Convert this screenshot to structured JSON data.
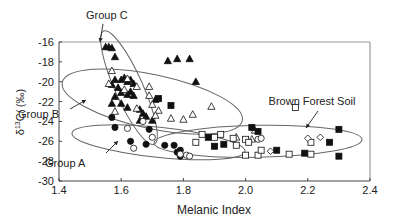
{
  "chart_data": {
    "type": "scatter",
    "title": "",
    "xlabel": "Melanic Index",
    "ylabel": "δ13C/ (‰)",
    "xlim": [
      1.4,
      2.4
    ],
    "ylim": [
      -30,
      -16
    ],
    "xticks": [
      "1.4",
      "1.6",
      "1.8",
      "2.0",
      "2.2",
      "2.4"
    ],
    "yticks": [
      "-16",
      "-18",
      "-20",
      "-22",
      "-24",
      "-26",
      "-28",
      "-30"
    ],
    "grid": false,
    "legend": null,
    "annotations": [
      {
        "text": "Group C",
        "x": 1.56,
        "y": -16.2
      },
      {
        "text": "Group B",
        "x": 1.58,
        "y": -22.4
      },
      {
        "text": "Group A",
        "x": 1.64,
        "y": -26.0
      },
      {
        "text": "Brown Forest Soil",
        "x": 2.06,
        "y": -23.4
      }
    ],
    "groups": [
      {
        "name": "Group C",
        "cx": 1.62,
        "cy": -21.5,
        "rx": 0.22,
        "ry": 0.045,
        "angle_deg": 62
      },
      {
        "name": "Group B",
        "cx": 1.68,
        "cy": -22.6,
        "rx": 0.29,
        "ry": 0.18,
        "angle_deg": 0
      },
      {
        "name": "Group A",
        "cx": 1.7,
        "cy": -26.2,
        "rx": 0.27,
        "ry": 0.07,
        "angle_deg": 0
      },
      {
        "name": "Brown Forest Soil",
        "cx": 2.03,
        "cy": -25.8,
        "rx": 0.33,
        "ry": 0.11,
        "angle_deg": 0
      }
    ],
    "series": [
      {
        "name": "filled-triangle",
        "marker": "triangle",
        "filled": true,
        "points": [
          [
            1.55,
            -16.5
          ],
          [
            1.56,
            -16.5
          ],
          [
            1.57,
            -16.6
          ],
          [
            1.58,
            -17.5
          ],
          [
            1.58,
            -19.8
          ],
          [
            1.6,
            -19.8
          ],
          [
            1.61,
            -19.6
          ],
          [
            1.62,
            -20.0
          ],
          [
            1.63,
            -19.8
          ],
          [
            1.64,
            -20.2
          ],
          [
            1.59,
            -20.6
          ],
          [
            1.57,
            -20.3
          ],
          [
            1.6,
            -21.1
          ],
          [
            1.62,
            -21.3
          ],
          [
            1.63,
            -21.0
          ],
          [
            1.64,
            -21.4
          ],
          [
            1.58,
            -21.5
          ],
          [
            1.6,
            -22.2
          ],
          [
            1.62,
            -22.6
          ],
          [
            1.57,
            -22.2
          ],
          [
            1.66,
            -22.8
          ],
          [
            1.67,
            -23.2
          ],
          [
            1.68,
            -23.5
          ],
          [
            1.66,
            -23.9
          ],
          [
            1.7,
            -23.9
          ],
          [
            1.71,
            -21.8
          ],
          [
            1.75,
            -17.9
          ],
          [
            1.78,
            -17.7
          ],
          [
            1.82,
            -17.7
          ],
          [
            1.84,
            -20.0
          ]
        ]
      },
      {
        "name": "open-triangle",
        "marker": "triangle",
        "filled": false,
        "points": [
          [
            1.57,
            -18.9
          ],
          [
            1.56,
            -20.2
          ],
          [
            1.62,
            -19.7
          ],
          [
            1.61,
            -20.8
          ],
          [
            1.65,
            -20.5
          ],
          [
            1.69,
            -20.5
          ],
          [
            1.69,
            -21.4
          ],
          [
            1.7,
            -22.3
          ],
          [
            1.72,
            -22.9
          ],
          [
            1.65,
            -22.7
          ],
          [
            1.58,
            -23.0
          ],
          [
            1.71,
            -23.4
          ],
          [
            1.76,
            -23.7
          ],
          [
            1.8,
            -23.8
          ],
          [
            1.83,
            -23.3
          ],
          [
            1.89,
            -22.5
          ],
          [
            1.97,
            -25.6
          ],
          [
            2.02,
            -25.8
          ],
          [
            2.03,
            -24.9
          ]
        ]
      },
      {
        "name": "filled-circle",
        "marker": "circle",
        "filled": true,
        "points": [
          [
            1.57,
            -23.6
          ],
          [
            1.58,
            -24.6
          ],
          [
            1.63,
            -26.0
          ],
          [
            1.68,
            -26.3
          ],
          [
            1.69,
            -24.8
          ],
          [
            1.74,
            -26.4
          ],
          [
            1.77,
            -26.4
          ],
          [
            1.78,
            -27.1
          ],
          [
            1.79,
            -27.5
          ],
          [
            1.79,
            -26.9
          ]
        ]
      },
      {
        "name": "open-circle",
        "marker": "circle",
        "filled": false,
        "points": [
          [
            1.62,
            -24.7
          ],
          [
            1.64,
            -26.7
          ],
          [
            1.67,
            -24.0
          ],
          [
            1.7,
            -25.6
          ],
          [
            1.79,
            -27.3
          ],
          [
            1.81,
            -27.4
          ],
          [
            1.82,
            -27.5
          ],
          [
            2.04,
            -25.8
          ],
          [
            2.05,
            -25.7
          ]
        ]
      },
      {
        "name": "filled-square",
        "marker": "square",
        "filled": true,
        "points": [
          [
            1.72,
            -21.7
          ],
          [
            1.76,
            -22.4
          ],
          [
            1.88,
            -25.6
          ],
          [
            1.9,
            -26.5
          ],
          [
            1.93,
            -26.3
          ],
          [
            2.02,
            -24.6
          ],
          [
            2.04,
            -25.0
          ],
          [
            2.1,
            -26.9
          ],
          [
            2.19,
            -27.2
          ],
          [
            2.27,
            -26.1
          ],
          [
            2.3,
            -24.8
          ],
          [
            2.3,
            -27.5
          ]
        ]
      },
      {
        "name": "open-square",
        "marker": "square",
        "filled": false,
        "points": [
          [
            1.84,
            -26.1
          ],
          [
            1.86,
            -25.3
          ],
          [
            1.9,
            -25.6
          ],
          [
            1.92,
            -25.3
          ],
          [
            1.96,
            -25.7
          ],
          [
            1.97,
            -26.4
          ],
          [
            2.0,
            -27.4
          ],
          [
            2.0,
            -25.8
          ],
          [
            2.01,
            -26.1
          ],
          [
            2.04,
            -27.4
          ],
          [
            2.05,
            -26.9
          ],
          [
            2.14,
            -27.3
          ],
          [
            2.16,
            -22.6
          ],
          [
            2.21,
            -26.1
          ],
          [
            2.21,
            -27.3
          ]
        ]
      },
      {
        "name": "open-diamond",
        "marker": "diamond",
        "filled": false,
        "points": [
          [
            2.08,
            -27.0
          ],
          [
            2.2,
            -25.7
          ],
          [
            2.24,
            -25.6
          ]
        ]
      }
    ]
  }
}
